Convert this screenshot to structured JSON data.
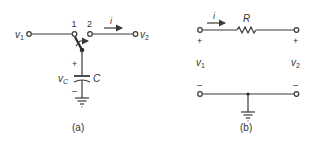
{
  "figure_a": {
    "caption": "(a)",
    "labels": {
      "v1": "v",
      "v1_sub": "1",
      "v2": "v",
      "v2_sub": "2",
      "node1": "1",
      "node2": "2",
      "current": "i",
      "vc": "v",
      "vc_sub": "C",
      "capacitor": "C",
      "plus": "+",
      "minus": "–"
    },
    "components": [
      "switch (node 1 / node 2)",
      "capacitor C",
      "ground"
    ]
  },
  "figure_b": {
    "caption": "(b)",
    "labels": {
      "current": "i",
      "resistor": "R",
      "v1": "v",
      "v1_sub": "1",
      "v2": "v",
      "v2_sub": "2",
      "plus_left": "+",
      "plus_right": "+",
      "minus_left": "–",
      "minus_right": "–"
    },
    "components": [
      "resistor R",
      "ground"
    ]
  },
  "colors": {
    "ink": "#3a3a3a",
    "background": "#ffffff"
  }
}
